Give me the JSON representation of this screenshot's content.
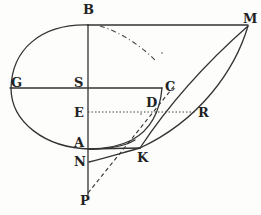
{
  "figure": {
    "type": "geometric-diagram",
    "ink_color": "#333333",
    "background": "#fdfdfc",
    "labels": {
      "B": "B",
      "M": "M",
      "G": "G",
      "S": "S",
      "C": "C",
      "E": "E",
      "D": "D",
      "R": "R",
      "A": "A",
      "N": "N",
      "K": "K",
      "P": "P"
    },
    "lines": [
      {
        "name": "BM",
        "style": "solid"
      },
      {
        "name": "BP axis",
        "style": "solid"
      },
      {
        "name": "GC",
        "style": "solid"
      },
      {
        "name": "ER",
        "style": "dotted"
      },
      {
        "name": "AK",
        "style": "solid"
      },
      {
        "name": "NK",
        "style": "solid curve"
      },
      {
        "name": "PM",
        "style": "dashed"
      },
      {
        "name": "MK",
        "style": "solid"
      },
      {
        "name": "MK curve",
        "style": "solid curve"
      },
      {
        "name": "B arc",
        "style": "dash-dot"
      },
      {
        "name": "ellipse BGA",
        "style": "solid curve"
      },
      {
        "name": "CD arc",
        "style": "solid curve"
      }
    ]
  }
}
